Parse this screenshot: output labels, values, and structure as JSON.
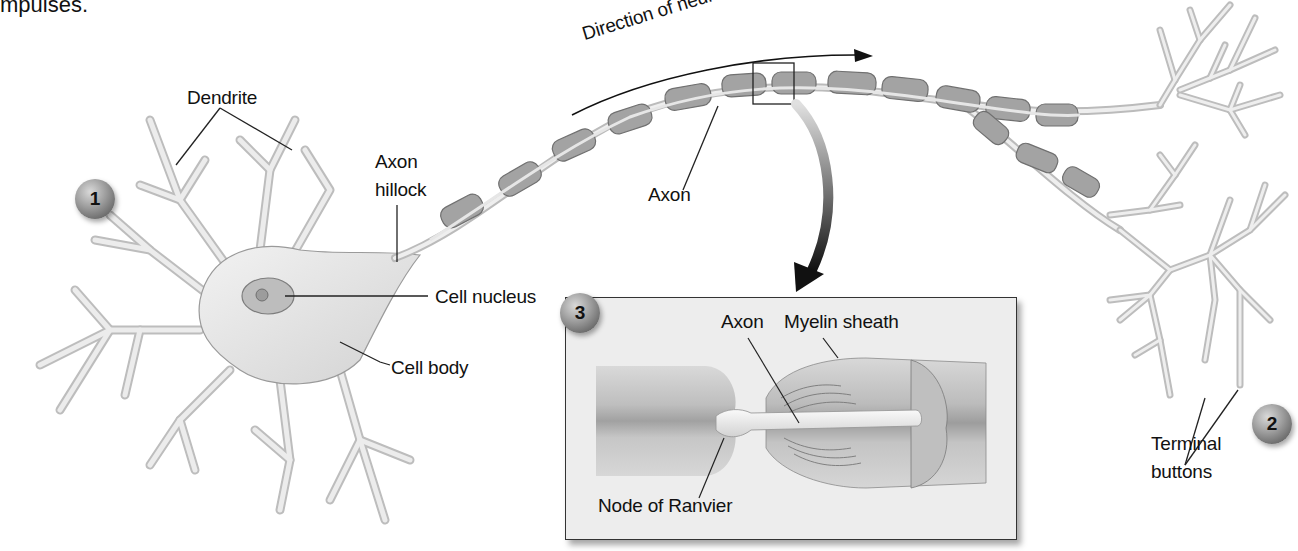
{
  "caption": {
    "text": "mpulses."
  },
  "diagram": {
    "labels": {
      "dendrite": "Dendrite",
      "axon_hillock_line1": "Axon",
      "axon_hillock_line2": "hillock",
      "axon": "Axon",
      "direction": "Direction of neural impulse",
      "cell_nucleus": "Cell nucleus",
      "cell_body": "Cell body",
      "terminal_line1": "Terminal",
      "terminal_line2": "buttons"
    },
    "badges": [
      {
        "number": "1"
      },
      {
        "number": "2"
      },
      {
        "number": "3"
      }
    ],
    "inset": {
      "labels": {
        "axon": "Axon",
        "myelin_sheath": "Myelin sheath",
        "node_of_ranvier": "Node of Ranvier"
      }
    },
    "colors": {
      "neuron_fill": "#e6e6e6",
      "neuron_outline": "#8a8a8a",
      "myelin_fill": "#9e9e9e",
      "myelin_outline": "#6e6e6e",
      "leader_line": "#222222",
      "inset_background": "#ededed"
    }
  }
}
